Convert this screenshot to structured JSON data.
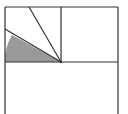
{
  "diagram": {
    "type": "geometry-figure",
    "colors": {
      "stroke": "#333333",
      "shade": "#999999",
      "background": "#ffffff"
    },
    "grid": {
      "left": 5,
      "top": 7,
      "right": 118,
      "mid_x": 61,
      "mid_y": 62,
      "bottom": 114
    },
    "center_vertex": {
      "x": 61,
      "y": 62
    },
    "rays": [
      {
        "from": [
          61,
          62
        ],
        "to": [
          29,
          7
        ]
      },
      {
        "from": [
          61,
          62
        ],
        "to": [
          5,
          29
        ]
      }
    ],
    "shaded_sector": {
      "center": [
        61,
        62
      ],
      "radius": 56,
      "bounded_by": [
        "lower-ray",
        "horizontal-midline"
      ]
    }
  }
}
